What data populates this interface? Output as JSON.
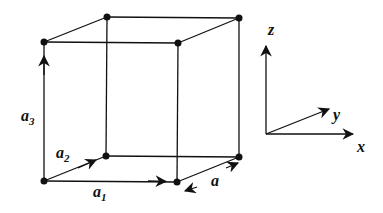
{
  "diagram": {
    "type": "cubic lattice unit cell",
    "labels": {
      "a1": {
        "main": "a",
        "sub": "1"
      },
      "a2": {
        "main": "a",
        "sub": "2"
      },
      "a3": {
        "main": "a",
        "sub": "3"
      },
      "a": "a"
    },
    "axes": {
      "x": "x",
      "y": "y",
      "z": "z"
    },
    "colors": {
      "line": "#111111",
      "background": "#ffffff"
    }
  }
}
